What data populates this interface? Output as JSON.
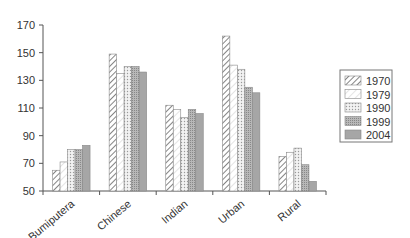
{
  "chart_data": {
    "type": "bar",
    "title": "",
    "xlabel": "",
    "ylabel": "",
    "ylim": [
      50,
      170
    ],
    "yticks": [
      50,
      70,
      90,
      110,
      130,
      150,
      170
    ],
    "grid": false,
    "legend_position": "right",
    "categories": [
      "Bumiputera",
      "Chinese",
      "Indian",
      "Urban",
      "Rural"
    ],
    "series": [
      {
        "name": "1970",
        "pattern": "diagonal-dense",
        "values": [
          65,
          149,
          112,
          162,
          75
        ]
      },
      {
        "name": "1979",
        "pattern": "diagonal-light",
        "values": [
          71,
          135,
          109,
          141,
          78
        ]
      },
      {
        "name": "1990",
        "pattern": "dotted",
        "values": [
          80,
          140,
          103,
          138,
          81
        ]
      },
      {
        "name": "1999",
        "pattern": "crosshatch-gray",
        "values": [
          80,
          140,
          109,
          125,
          69
        ]
      },
      {
        "name": "2004",
        "pattern": "solid-gray",
        "values": [
          83,
          136,
          106,
          121,
          57
        ]
      }
    ]
  },
  "legend": {
    "items": [
      "1970",
      "1979",
      "1990",
      "1999",
      "2004"
    ]
  }
}
